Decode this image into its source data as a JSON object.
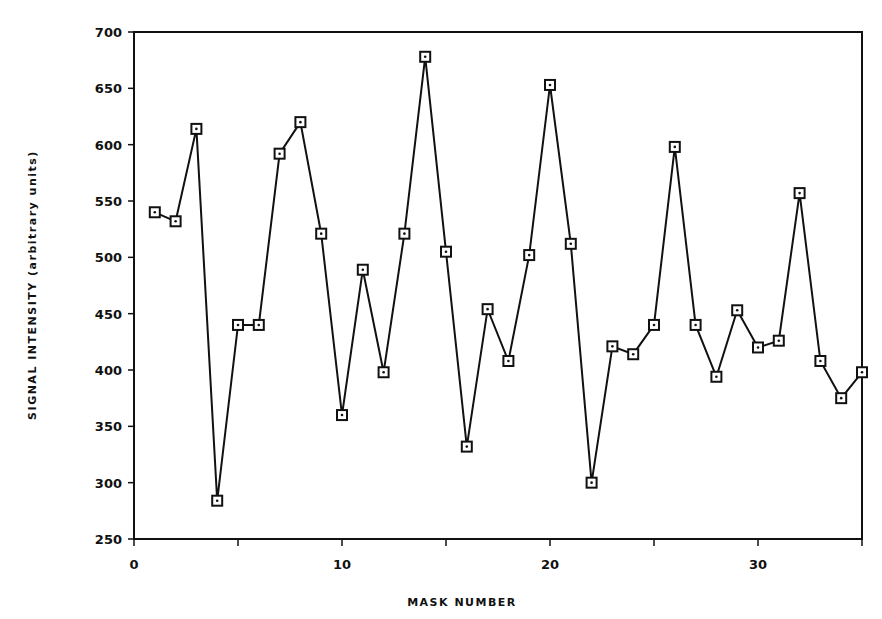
{
  "chart_data": {
    "type": "line",
    "title": "",
    "xlabel": "MASK NUMBER",
    "ylabel": "SIGNAL INTENSITY (arbitrary units)",
    "xlim": [
      0,
      35
    ],
    "ylim": [
      250,
      700
    ],
    "x_ticks": [
      0,
      10,
      20,
      30
    ],
    "x_minor_ticks": [
      5,
      15,
      25,
      35
    ],
    "y_ticks": [
      250,
      300,
      350,
      400,
      450,
      500,
      550,
      600,
      650,
      700
    ],
    "grid": false,
    "legend": null,
    "marker": "open-square",
    "line_color": "#111111",
    "x": [
      1,
      2,
      3,
      4,
      5,
      6,
      7,
      8,
      9,
      10,
      11,
      12,
      13,
      14,
      15,
      16,
      17,
      18,
      19,
      20,
      21,
      22,
      23,
      24,
      25,
      26,
      27,
      28,
      29,
      30,
      31,
      32,
      33,
      34,
      35
    ],
    "series": [
      {
        "name": "Signal intensity",
        "values": [
          540,
          532,
          614,
          284,
          440,
          440,
          592,
          620,
          521,
          360,
          489,
          398,
          521,
          678,
          505,
          332,
          454,
          408,
          502,
          653,
          512,
          300,
          421,
          414,
          440,
          598,
          440,
          394,
          453,
          420,
          426,
          557,
          408,
          375,
          398
        ]
      }
    ]
  }
}
